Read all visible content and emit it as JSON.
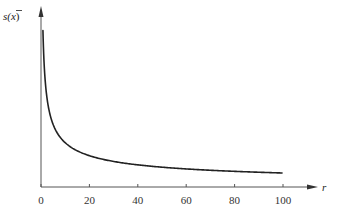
{
  "chart_data": {
    "type": "line",
    "title": "",
    "xlabel": "r",
    "ylabel": "s(x̄)",
    "ylabel_parts": {
      "base": "s(",
      "var": "x",
      "close": ")"
    },
    "xlim": [
      0,
      100
    ],
    "ylim": "unlabeled",
    "grid": false,
    "legend": null,
    "x_ticks": [
      0,
      20,
      40,
      60,
      80,
      100
    ],
    "x_tick_labels": [
      "0",
      "20",
      "40",
      "60",
      "80",
      "100"
    ],
    "y_ticks": [],
    "series": [
      {
        "name": "s(x̄) vs r",
        "shape": "decreasing, proportional to 1/sqrt(r)",
        "x": [
          1,
          2,
          3,
          4,
          6,
          8,
          10,
          15,
          20,
          30,
          40,
          50,
          60,
          70,
          80,
          90,
          100
        ],
        "y_relative": [
          1.0,
          0.707,
          0.577,
          0.5,
          0.408,
          0.354,
          0.316,
          0.258,
          0.224,
          0.183,
          0.158,
          0.141,
          0.129,
          0.12,
          0.112,
          0.105,
          0.1
        ],
        "color": "#222222"
      }
    ]
  },
  "colors": {
    "axis": "#555555",
    "curve": "#222222",
    "background": "#ffffff"
  }
}
